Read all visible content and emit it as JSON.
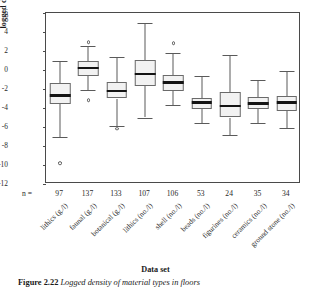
{
  "figure": {
    "caption_prefix": "Figure",
    "caption_number": "2.22",
    "caption_text": "Logged density of material types in floors"
  },
  "chart_data": {
    "type": "box",
    "title": "",
    "xlabel": "Data set",
    "ylabel": "logged density",
    "ylim": [
      -12,
      6
    ],
    "yticks": [
      6,
      4,
      2,
      0,
      -2,
      -4,
      -6,
      -8,
      -10,
      -12
    ],
    "ytick_labels": [
      "6",
      "4",
      "2",
      "0",
      "-2",
      "-4",
      "-6",
      "-8",
      "-10",
      "-12"
    ],
    "grid": false,
    "legend": "none",
    "n_row_label": "n =",
    "categories": [
      "lithics (g./l)",
      "faunal (g./l)",
      "botanical (g./l)",
      "lithics (no./l)",
      "shell (no./l)",
      "beads (no./l)",
      "figurines (no./l)",
      "ceramics (no./l)",
      "ground stone (no./l)"
    ],
    "n": [
      97,
      137,
      133,
      107,
      106,
      53,
      24,
      35,
      34
    ],
    "boxes": [
      {
        "category": "lithics (g./l)",
        "whisker_low": -7.1,
        "q1": -3.6,
        "median": -2.7,
        "q3": -1.4,
        "whisker_high": 1.0,
        "outliers": [
          -9.8
        ]
      },
      {
        "category": "faunal (g./l)",
        "whisker_low": -2.1,
        "q1": -0.6,
        "median": 0.2,
        "q3": 0.9,
        "whisker_high": 2.5,
        "outliers": [
          2.9,
          -3.2
        ]
      },
      {
        "category": "botanical (g./l)",
        "whisker_low": -5.9,
        "q1": -3.0,
        "median": -2.2,
        "q3": -1.3,
        "whisker_high": 1.4,
        "outliers": [
          -6.2
        ]
      },
      {
        "category": "lithics (no./l)",
        "whisker_low": -5.0,
        "q1": -1.7,
        "median": -0.4,
        "q3": 1.1,
        "whisker_high": 4.9,
        "outliers": []
      },
      {
        "category": "shell (no./l)",
        "whisker_low": -3.7,
        "q1": -2.2,
        "median": -1.3,
        "q3": -0.5,
        "whisker_high": 1.8,
        "outliers": [
          2.8
        ]
      },
      {
        "category": "beads (no./l)",
        "whisker_low": -5.6,
        "q1": -4.1,
        "median": -3.4,
        "q3": -2.9,
        "whisker_high": -0.6,
        "outliers": []
      },
      {
        "category": "figurines (no./l)",
        "whisker_low": -6.8,
        "q1": -5.0,
        "median": -3.8,
        "q3": -2.3,
        "whisker_high": 1.6,
        "outliers": []
      },
      {
        "category": "ceramics (no./l)",
        "whisker_low": -5.6,
        "q1": -4.1,
        "median": -3.5,
        "q3": -2.8,
        "whisker_high": -1.0,
        "outliers": []
      },
      {
        "category": "ground stone (no./l)",
        "whisker_low": -6.1,
        "q1": -4.3,
        "median": -3.4,
        "q3": -2.7,
        "whisker_high": -0.1,
        "outliers": []
      }
    ]
  },
  "colors": {
    "box_fill": "#f2f2f2",
    "box_stroke": "#6a6a6a",
    "median": "#141414",
    "whisker": "#5a5a5a",
    "frame": "#4a4a4a",
    "text": "#1a1a1a"
  }
}
